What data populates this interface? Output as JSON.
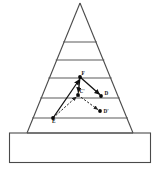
{
  "figure": {
    "canvas": {
      "width": 161,
      "height": 173
    },
    "colors": {
      "outline": "#4a4a4a",
      "course_line": "#5a5a5a",
      "vector": "#111111",
      "dashed_vector": "#222222",
      "node": "#0a0a0a",
      "background": "#ffffff"
    },
    "pyramid": {
      "apex": {
        "x": 80,
        "y": 3
      },
      "left_foot": {
        "x": 27,
        "y": 133
      },
      "right_foot": {
        "x": 133,
        "y": 133
      },
      "course_lines_y": [
        42,
        60,
        78,
        98,
        118,
        133
      ],
      "base_block": {
        "x": 9,
        "y": 133,
        "width": 142,
        "height": 30
      }
    },
    "points": [
      {
        "id": "F",
        "label": "F",
        "x": 80,
        "y": 77,
        "label_dx": 1.5,
        "label_dy": -2.5
      },
      {
        "id": "Cp",
        "label": "C'",
        "x": 78,
        "y": 95,
        "label_dx": 1.5,
        "label_dy": -2.5
      },
      {
        "id": "D",
        "label": "D",
        "x": 101,
        "y": 96,
        "label_dx": 3.5,
        "label_dy": -1.5
      },
      {
        "id": "Dp",
        "label": "D'",
        "x": 100,
        "y": 111,
        "label_dx": 3.5,
        "label_dy": 1.8
      },
      {
        "id": "E",
        "label": "E",
        "x": 53,
        "y": 118,
        "label_dx": -1.0,
        "label_dy": 5.0
      }
    ],
    "vectors": [
      {
        "name": "E-to-F",
        "from": "E",
        "to": "F",
        "style": "solid",
        "arrow": true
      },
      {
        "name": "F-to-D",
        "from": "F",
        "to": "D",
        "style": "solid",
        "arrow": true
      },
      {
        "name": "F-to-Cp",
        "from": "F",
        "to": "Cp",
        "style": "solid",
        "arrow": true
      },
      {
        "name": "E-to-Cp",
        "from": "E",
        "to": "Cp",
        "style": "dashed",
        "arrow": true
      },
      {
        "name": "Cp-to-Dp",
        "from": "Cp",
        "to": "Dp",
        "style": "dashed",
        "arrow": true
      }
    ]
  }
}
